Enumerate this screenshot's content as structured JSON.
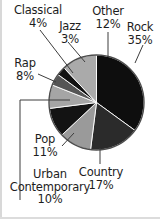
{
  "figure": {
    "background_color": "#ffffff",
    "text_color": "#1d1d1d",
    "outline_color": "#4d4d4d"
  },
  "chart_data": {
    "type": "pie",
    "title": "",
    "subtitle": "",
    "xlabel": "",
    "ylabel": "",
    "legend_position": "callout-labels",
    "grid": false,
    "units": "percent",
    "total": 100,
    "categories": [
      "Rock",
      "Country",
      "Urban Contemporary",
      "Pop",
      "Rap",
      "Classical",
      "Jazz",
      "Other"
    ],
    "values": [
      35,
      17,
      10,
      11,
      8,
      4,
      3,
      12
    ],
    "slices": [
      {
        "label": "Rock",
        "value": 35,
        "value_text": "35%",
        "color": "#0e0e0e",
        "start_angle": 0,
        "end_angle": 126
      },
      {
        "label": "Country",
        "value": 17,
        "value_text": "17%",
        "color": "#2b2b2b",
        "start_angle": 126,
        "end_angle": 187.2
      },
      {
        "label": "Pop",
        "value": 11,
        "value_text": "11%",
        "color": "#9a9a9a",
        "start_angle": 187.2,
        "end_angle": 226.8
      },
      {
        "label": "Urban Contemporary",
        "value": 10,
        "value_text": "10%",
        "color": "#131313",
        "start_angle": 226.8,
        "end_angle": 262.8
      },
      {
        "label": "Rap",
        "value": 8,
        "value_text": "8%",
        "color": "#a5a5a5",
        "start_angle": 262.8,
        "end_angle": 291.6
      },
      {
        "label": "Classical",
        "value": 4,
        "value_text": "4%",
        "color": "#555555",
        "start_angle": 291.6,
        "end_angle": 306
      },
      {
        "label": "Jazz",
        "value": 3,
        "value_text": "3%",
        "color": "#111111",
        "start_angle": 306,
        "end_angle": 316.8
      },
      {
        "label": "Other",
        "value": 12,
        "value_text": "12%",
        "color": "#aaaaaa",
        "start_angle": 316.8,
        "end_angle": 360
      }
    ]
  },
  "labels": {
    "classical": {
      "name": "Classical",
      "pct": "4%"
    },
    "jazz": {
      "name": "Jazz",
      "pct": "3%"
    },
    "other": {
      "name": "Other",
      "pct": "12%"
    },
    "rock": {
      "name": "Rock",
      "pct": "35%"
    },
    "rap": {
      "name": "Rap",
      "pct": "8%"
    },
    "pop": {
      "name": "Pop",
      "pct": "11%"
    },
    "urban": {
      "name_line1": "Urban",
      "name_line2": "Contemporary",
      "pct": "10%"
    },
    "country": {
      "name": "Country",
      "pct": "17%"
    }
  }
}
